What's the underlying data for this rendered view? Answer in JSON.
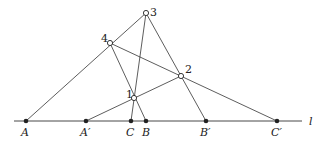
{
  "diagram": {
    "line_label": "l",
    "base_points": [
      {
        "id": "A",
        "label": "A",
        "x": 26,
        "y": 121
      },
      {
        "id": "A'",
        "label": "A′",
        "x": 86,
        "y": 121
      },
      {
        "id": "C",
        "label": "C",
        "x": 131,
        "y": 121
      },
      {
        "id": "B",
        "label": "B",
        "x": 146,
        "y": 121
      },
      {
        "id": "B'",
        "label": "B′",
        "x": 206,
        "y": 121
      },
      {
        "id": "C'",
        "label": "C′",
        "x": 277,
        "y": 121
      }
    ],
    "numbered_points": [
      {
        "id": "1",
        "label": "1",
        "x": 134,
        "y": 98
      },
      {
        "id": "2",
        "label": "2",
        "x": 181,
        "y": 76
      },
      {
        "id": "3",
        "label": "3",
        "x": 146,
        "y": 13
      },
      {
        "id": "4",
        "label": "4",
        "x": 110,
        "y": 43
      }
    ],
    "segments": [
      [
        "A",
        "3"
      ],
      [
        "A'",
        "2"
      ],
      [
        "C",
        "3"
      ],
      [
        "B",
        "4"
      ],
      [
        "4",
        "C'"
      ],
      [
        "3",
        "B'"
      ]
    ]
  }
}
